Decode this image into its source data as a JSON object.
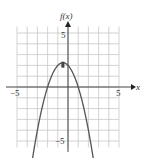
{
  "chart_data": {
    "type": "line",
    "title": "",
    "xlabel": "x",
    "ylabel": "f(x)",
    "xlim": [
      -5,
      5
    ],
    "ylim": [
      -5,
      5
    ],
    "grid": true,
    "x_ticks_labeled": [
      "-5",
      "5"
    ],
    "y_ticks_labeled": [
      "5",
      "-5"
    ],
    "function": "f(x) = -x^2 - x + 2",
    "vertex": [
      -0.5,
      2.25
    ],
    "roots": [
      -2,
      1
    ],
    "series": [
      {
        "name": "f(x)",
        "x": [
          -3.8,
          -3,
          -2.5,
          -2,
          -1.5,
          -1,
          -0.5,
          0,
          0.5,
          1,
          1.5,
          2,
          2.8
        ],
        "values": [
          -8.64,
          -4,
          -1.75,
          0,
          1.25,
          2,
          2.25,
          2,
          1.25,
          0,
          -1.75,
          -4,
          -8.64
        ]
      }
    ],
    "colors": {
      "curve": "#555555",
      "grid": "#c8c8c8",
      "axis": "#444444"
    }
  },
  "labels": {
    "y_axis": "f(x)",
    "x_axis": "x",
    "x_neg": "−5",
    "x_pos": "5",
    "y_pos": "5",
    "y_neg": "−5"
  }
}
